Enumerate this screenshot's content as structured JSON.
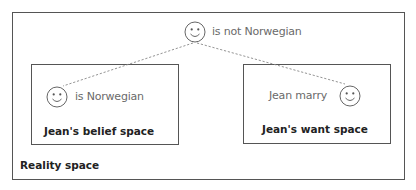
{
  "diagram": {
    "spaces": {
      "reality": {
        "title": "Reality space"
      },
      "belief": {
        "title": "Jean's belief space"
      },
      "want": {
        "title": "Jean's want space"
      }
    },
    "nodes": {
      "reality_entity": {
        "icon": "smiley-face-icon",
        "label": "is not Norwegian"
      },
      "belief_entity": {
        "icon": "smiley-face-icon",
        "label": "is Norwegian"
      },
      "want_entity": {
        "icon": "smiley-face-icon",
        "label": "Jean marry"
      }
    },
    "connectors": [
      {
        "from": "reality_entity",
        "to": "belief_entity",
        "style": "dashed"
      },
      {
        "from": "reality_entity",
        "to": "want_entity",
        "style": "dashed"
      }
    ],
    "colors": {
      "border": "#555555",
      "light_text": "#6a6a6a",
      "bold_text": "#222222",
      "connector": "#888888"
    }
  }
}
